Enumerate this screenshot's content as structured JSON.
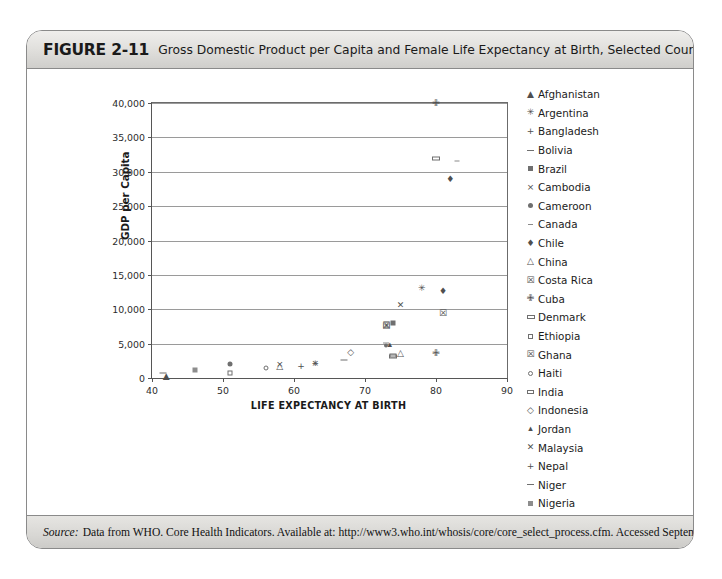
{
  "figure": {
    "number": "FIGURE 2-11",
    "caption": "Gross Domestic Product per Capita and Female Life Expectancy at Birth, Selected Countries, 2004",
    "source_label": "Source:",
    "source_text": "Data from WHO. Core Health Indicators. Available at: http://www3.who.int/whosis/core/core_select_process.cfm. Accessed September 24, 2006."
  },
  "chart_data": {
    "type": "scatter",
    "title": "Gross Domestic Product per Capita and Female Life Expectancy at Birth, Selected Countries, 2004",
    "xlabel": "LIFE EXPECTANCY AT BIRTH",
    "ylabel": "GDP per Capita",
    "xlim": [
      40,
      90
    ],
    "ylim": [
      0,
      40000
    ],
    "xticks": [
      40,
      50,
      60,
      70,
      80,
      90
    ],
    "yticks": [
      0,
      5000,
      10000,
      15000,
      20000,
      25000,
      30000,
      35000,
      40000
    ],
    "ytick_labels": [
      "0",
      "5,000",
      "10,000",
      "15,000",
      "20,000",
      "25,000",
      "30,000",
      "35,000",
      "40,000"
    ],
    "xtick_labels": [
      "40",
      "50",
      "60",
      "70",
      "80",
      "90"
    ],
    "grid": "horizontal",
    "legend_position": "right",
    "points": [
      {
        "name": "Afghanistan",
        "symbol": "triangle-filled",
        "glyph": "▲",
        "x": 42,
        "y": 300
      },
      {
        "name": "Argentina",
        "symbol": "x-bold",
        "glyph": "✳",
        "x": 78,
        "y": 13100
      },
      {
        "name": "Bangladesh",
        "symbol": "plus",
        "glyph": "+",
        "x": 61,
        "y": 1800
      },
      {
        "name": "Bolivia",
        "symbol": "dash",
        "glyph": "–",
        "x": 67,
        "y": 2600
      },
      {
        "name": "Brazil",
        "symbol": "square-filled",
        "glyph": "■",
        "x": 74,
        "y": 8000
      },
      {
        "name": "Cambodia",
        "symbol": "x-thin",
        "glyph": "×",
        "x": 58,
        "y": 2000
      },
      {
        "name": "Cameroon",
        "symbol": "circle-filled",
        "glyph": "●",
        "x": 51,
        "y": 2000
      },
      {
        "name": "Canada",
        "symbol": "dash-small",
        "glyph": "-",
        "x": 83,
        "y": 31500
      },
      {
        "name": "Chile",
        "symbol": "diamond-filled",
        "glyph": "♦",
        "x": 81,
        "y": 12600
      },
      {
        "name": "China",
        "symbol": "triangle-open",
        "glyph": "△",
        "x": 75,
        "y": 3600
      },
      {
        "name": "Costa Rica",
        "symbol": "hourglass",
        "glyph": "☒",
        "x": 81,
        "y": 9500
      },
      {
        "name": "Cuba",
        "symbol": "cross-open",
        "glyph": "✙",
        "x": 80,
        "y": 3700
      },
      {
        "name": "Denmark",
        "symbol": "rect-open",
        "glyph": "▭",
        "x": 80,
        "y": 32000
      },
      {
        "name": "Ethiopia",
        "symbol": "square-open",
        "glyph": "□",
        "x": 51,
        "y": 700
      },
      {
        "name": "Ghana",
        "symbol": "x-box",
        "glyph": "☒",
        "x": 73,
        "y": 7700
      },
      {
        "name": "Haiti",
        "symbol": "circle-open",
        "glyph": "○",
        "x": 56,
        "y": 1500
      },
      {
        "name": "India",
        "symbol": "rect-open-small",
        "glyph": "▭",
        "x": 74,
        "y": 3300
      },
      {
        "name": "Indonesia",
        "symbol": "diamond-open",
        "glyph": "◇",
        "x": 68,
        "y": 3800
      },
      {
        "name": "Jordan",
        "symbol": "triangle-small",
        "glyph": "▴",
        "x": 73.5,
        "y": 4900
      },
      {
        "name": "Malaysia",
        "symbol": "x-light",
        "glyph": "✕",
        "x": 75,
        "y": 10600
      },
      {
        "name": "Nepal",
        "symbol": "plus-thin",
        "glyph": "+",
        "x": 63,
        "y": 2200
      },
      {
        "name": "Niger",
        "symbol": "dash-thin",
        "glyph": "–",
        "x": 41.5,
        "y": 800
      },
      {
        "name": "Nigeria",
        "symbol": "square-grey",
        "glyph": "■",
        "x": 46,
        "y": 1200
      },
      {
        "name": "Pakistan",
        "symbol": "x-grey",
        "glyph": "×",
        "x": 63,
        "y": 2200
      },
      {
        "name": "Peru",
        "symbol": "circle-dot",
        "glyph": "●",
        "x": 73,
        "y": 4800
      },
      {
        "name": "Philippines",
        "symbol": "dash-mid",
        "glyph": "-",
        "x": 73,
        "y": 5100
      },
      {
        "name": "Singapore",
        "symbol": "diamond-dot",
        "glyph": "♦",
        "x": 82,
        "y": 29000
      },
      {
        "name": "Sri Lanka",
        "symbol": "triangle-outline",
        "glyph": "△",
        "x": 58,
        "y": 1800
      },
      {
        "name": "Turkey",
        "symbol": "hourglass-box",
        "glyph": "☒",
        "x": 73,
        "y": 7500
      },
      {
        "name": "United States of America",
        "symbol": "cross-fat",
        "glyph": "✙",
        "x": 80,
        "y": 40000
      },
      {
        "name": "Vietnam",
        "symbol": "rect-wide",
        "glyph": "▭",
        "x": 74,
        "y": 3200
      }
    ]
  },
  "legend": {
    "items": [
      {
        "symbol": "triangle-filled",
        "label": "Afghanistan"
      },
      {
        "symbol": "x-bold",
        "label": "Argentina"
      },
      {
        "symbol": "plus",
        "label": "Bangladesh"
      },
      {
        "symbol": "dash",
        "label": "Bolivia"
      },
      {
        "symbol": "square-filled",
        "label": "Brazil"
      },
      {
        "symbol": "x-thin",
        "label": "Cambodia"
      },
      {
        "symbol": "circle-filled",
        "label": "Cameroon"
      },
      {
        "symbol": "dash-small",
        "label": "Canada"
      },
      {
        "symbol": "diamond-filled",
        "label": "Chile"
      },
      {
        "symbol": "triangle-open",
        "label": "China"
      },
      {
        "symbol": "hourglass",
        "label": "Costa Rica"
      },
      {
        "symbol": "cross-open",
        "label": "Cuba"
      },
      {
        "symbol": "rect-open",
        "label": "Denmark"
      },
      {
        "symbol": "square-open",
        "label": "Ethiopia"
      },
      {
        "symbol": "x-box",
        "label": "Ghana"
      },
      {
        "symbol": "circle-open",
        "label": "Haiti"
      },
      {
        "symbol": "rect-open-small",
        "label": "India"
      },
      {
        "symbol": "diamond-open",
        "label": "Indonesia"
      },
      {
        "symbol": "triangle-small",
        "label": "Jordan"
      },
      {
        "symbol": "x-light",
        "label": "Malaysia"
      },
      {
        "symbol": "plus-thin",
        "label": "Nepal"
      },
      {
        "symbol": "dash-thin",
        "label": "Niger"
      },
      {
        "symbol": "square-grey",
        "label": "Nigeria"
      },
      {
        "symbol": "x-grey",
        "label": "Pakistan"
      },
      {
        "symbol": "circle-dot",
        "label": "Peru"
      },
      {
        "symbol": "dash-mid",
        "label": "Philippines"
      },
      {
        "symbol": "diamond-dot",
        "label": "Singapore"
      },
      {
        "symbol": "triangle-outline",
        "label": "Sri Lanka"
      },
      {
        "symbol": "hourglass-box",
        "label": "Turkey"
      },
      {
        "symbol": "cross-fat",
        "label": "United States of America"
      },
      {
        "symbol": "rect-wide",
        "label": "Vietnam"
      }
    ]
  },
  "colors": {
    "frame_border": "#8a8a8a",
    "header_band": "#e2e1de",
    "gridline": "#9a9a9a",
    "axis": "#565656",
    "marker": "#4f4f4f",
    "text": "#1a1a1a"
  }
}
